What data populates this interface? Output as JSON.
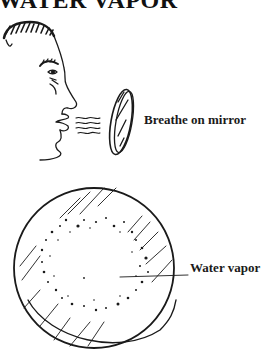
{
  "title": "WATER VAPOR",
  "labels": {
    "breathe": "Breathe on mirror",
    "water_vapor": "Water vapor"
  },
  "figures": [
    {
      "name": "person-profile",
      "description": "Side profile of a person's head breathing out"
    },
    {
      "name": "hand-mirror-side",
      "description": "Small oval mirror seen edge-on receiving breath"
    },
    {
      "name": "fogged-mirror",
      "description": "Round mirror face-on with fogged ring of water droplets"
    }
  ],
  "colors": {
    "ink": "#1a1a1a",
    "background": "#ffffff"
  }
}
